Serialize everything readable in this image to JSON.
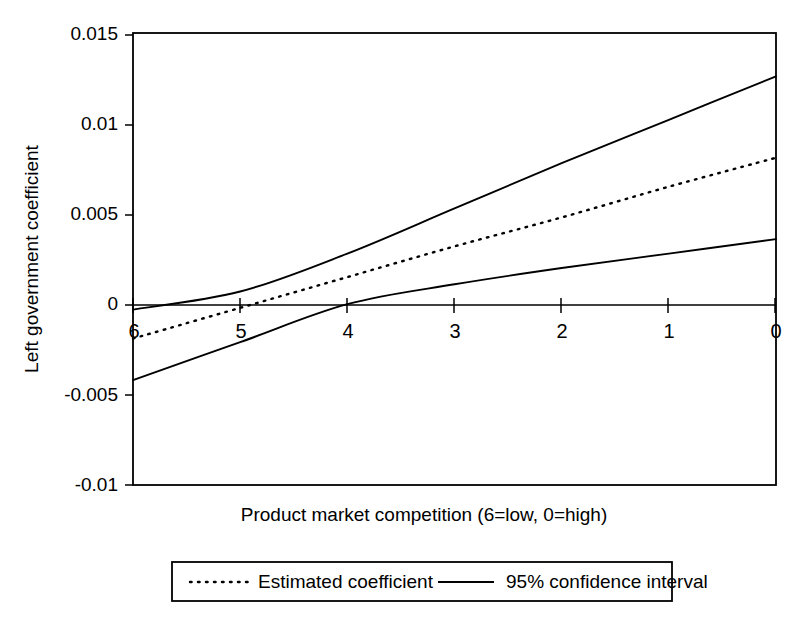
{
  "chart_data": {
    "type": "line",
    "title": "",
    "xlabel": "Product market competition (6=low, 0=high)",
    "ylabel": "Left government coefficient",
    "xlim": [
      6,
      0
    ],
    "ylim": [
      -0.01,
      0.015
    ],
    "x_ticks": [
      "6",
      "5",
      "4",
      "3",
      "2",
      "1",
      "0"
    ],
    "x_tick_values": [
      6,
      5,
      4,
      3,
      2,
      1,
      0
    ],
    "y_ticks": [
      "0.015",
      "0.01",
      "0.005",
      "0",
      "-0.005",
      "-0.01"
    ],
    "y_tick_values": [
      0.015,
      0.01,
      0.005,
      0,
      -0.005,
      -0.01
    ],
    "grid": false,
    "legend_position": "below-plot",
    "x": [
      6,
      5,
      4,
      3,
      2,
      1,
      0
    ],
    "series": [
      {
        "name": "Estimated coefficient",
        "style": "dotted",
        "values": [
          -0.0019,
          -0.0002,
          0.0015,
          0.0032,
          0.0048,
          0.0065,
          0.0081
        ]
      },
      {
        "name": "95% confidence interval upper",
        "style": "solid",
        "values": [
          -0.0003,
          0.0007,
          0.0028,
          0.0053,
          0.0078,
          0.0102,
          0.0126
        ]
      },
      {
        "name": "95% confidence interval lower",
        "style": "solid",
        "values": [
          -0.0042,
          -0.0021,
          0.0,
          0.0011,
          0.002,
          0.0028,
          0.0036
        ]
      }
    ],
    "zero_line": 0,
    "legend": [
      {
        "label": "Estimated coefficient",
        "style": "dotted"
      },
      {
        "label": "95% confidence interval",
        "style": "solid"
      }
    ]
  },
  "axes": {
    "y_label": "Left government coefficient",
    "x_label": "Product market competition (6=low, 0=high)",
    "y_tick_labels": [
      "0.015",
      "0.01",
      "0.005",
      "0",
      "-0.005",
      "-0.01"
    ],
    "x_tick_labels": [
      "6",
      "5",
      "4",
      "3",
      "2",
      "1",
      "0"
    ]
  },
  "legend": {
    "estimated_label": "Estimated coefficient",
    "ci_label": "95% confidence interval"
  },
  "colors": {
    "line": "#000000",
    "background": "#ffffff",
    "axis": "#000000"
  }
}
